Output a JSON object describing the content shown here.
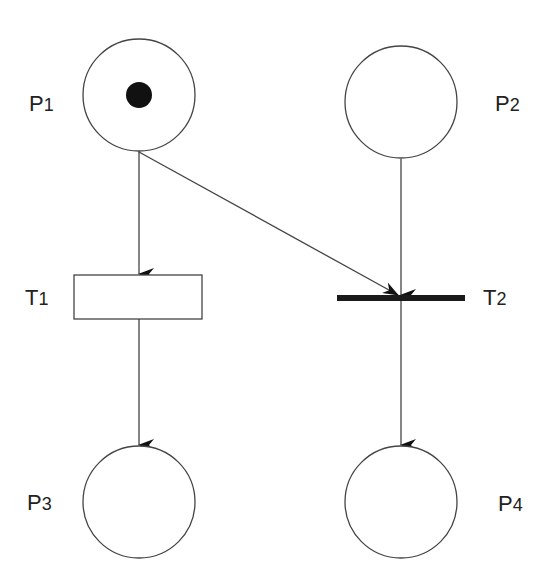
{
  "diagram": {
    "type": "petri-net",
    "colors": {
      "stroke": "#444444",
      "fill": "#ffffff",
      "token": "#111111",
      "bar": "#1a1a1a",
      "text": "#222222"
    },
    "places": [
      {
        "id": "P1",
        "letter": "P",
        "index": "1",
        "tokens": 1
      },
      {
        "id": "P2",
        "letter": "P",
        "index": "2",
        "tokens": 0
      },
      {
        "id": "P3",
        "letter": "P",
        "index": "3",
        "tokens": 0
      },
      {
        "id": "P4",
        "letter": "P",
        "index": "4",
        "tokens": 0
      }
    ],
    "transitions": [
      {
        "id": "T1",
        "letter": "T",
        "index": "1",
        "style": "rectangle"
      },
      {
        "id": "T2",
        "letter": "T",
        "index": "2",
        "style": "bar"
      }
    ],
    "arcs": [
      {
        "from": "P1",
        "to": "T1"
      },
      {
        "from": "P1",
        "to": "T2"
      },
      {
        "from": "P2",
        "to": "T2"
      },
      {
        "from": "T1",
        "to": "P3"
      },
      {
        "from": "T2",
        "to": "P4"
      }
    ]
  }
}
